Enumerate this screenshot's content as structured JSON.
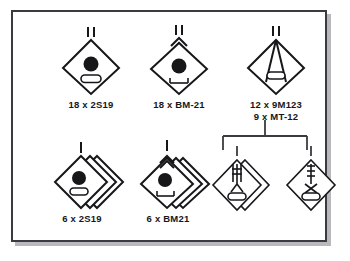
{
  "diagram": {
    "background_color": "#ffffff",
    "border_color": "#3a3a40",
    "ink_color": "#17171a",
    "shadow_color": "#b9b9bd"
  },
  "units": [
    {
      "id": "sp-howitzer-battalion",
      "name": "self-propelled-howitzer-battalion",
      "echelon": "II",
      "echelon_meaning": "battalion",
      "symbol": "artillery-diamond-self-propelled",
      "stacked": false,
      "equipment_lines": [
        "18 x 2S19"
      ]
    },
    {
      "id": "mrl-battalion",
      "name": "multiple-rocket-launcher-battalion",
      "echelon": "II",
      "echelon_meaning": "battalion",
      "symbol": "rocket-artillery-diamond-self-propelled",
      "stacked": false,
      "equipment_lines": [
        "18 x BM-21"
      ]
    },
    {
      "id": "antitank-battalion",
      "name": "antitank-battalion",
      "echelon": "II",
      "echelon_meaning": "battalion",
      "symbol": "antitank-missile-diamond",
      "stacked": false,
      "equipment_lines": [
        "12 x 9M123",
        "9 x MT-12"
      ]
    },
    {
      "id": "sp-howitzer-battery",
      "name": "self-propelled-howitzer-battery",
      "echelon": "I",
      "echelon_meaning": "battery",
      "symbol": "artillery-diamond-self-propelled",
      "stacked": true,
      "equipment_lines": [
        "6 x 2S19"
      ]
    },
    {
      "id": "mrl-battery",
      "name": "multiple-rocket-launcher-battery",
      "echelon": "I",
      "echelon_meaning": "battery",
      "symbol": "rocket-artillery-diamond-self-propelled",
      "stacked": true,
      "equipment_lines": [
        "6 x BM21"
      ]
    },
    {
      "id": "atgm-battery",
      "name": "antitank-guided-missile-battery",
      "echelon": "I",
      "echelon_meaning": "battery",
      "symbol": "antitank-guided-missile-diamond",
      "stacked": true,
      "equipment_lines": []
    },
    {
      "id": "antitank-gun-battery",
      "name": "antitank-gun-battery",
      "echelon": "I",
      "echelon_meaning": "battery",
      "symbol": "antitank-gun-diamond",
      "stacked": false,
      "equipment_lines": []
    }
  ],
  "connector": {
    "name": "command-bracket",
    "parent_unit_id": "antitank-battalion",
    "child_unit_ids": [
      "atgm-battery",
      "antitank-gun-battery"
    ]
  }
}
